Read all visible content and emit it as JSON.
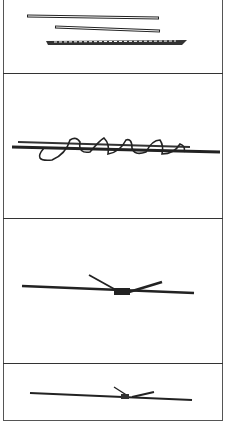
{
  "figure": {
    "panels": [
      {
        "id": "step-1",
        "description": "Three separate sticks/twigs laid parallel"
      },
      {
        "id": "step-2",
        "description": "Wire spiral-wrapped around a stick"
      },
      {
        "id": "step-3",
        "description": "Two sticks crossed and bound at center with wire"
      },
      {
        "id": "step-4",
        "description": "Finished binding, two sticks joined end to end"
      }
    ],
    "colors": {
      "ink": "#222222",
      "border": "#444444",
      "background": "#ffffff"
    }
  }
}
